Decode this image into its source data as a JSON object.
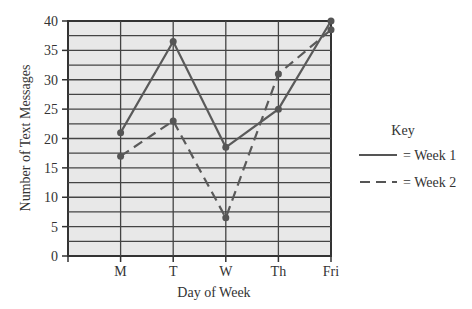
{
  "chart_data": {
    "type": "line",
    "title": "",
    "xlabel": "Day of Week",
    "ylabel": "Number of Text Messages",
    "categories": [
      "M",
      "T",
      "W",
      "Th",
      "Fri"
    ],
    "series": [
      {
        "name": "Week 1",
        "style": "solid",
        "values": [
          21,
          36.5,
          18.5,
          25,
          40
        ]
      },
      {
        "name": "Week 2",
        "style": "dashed",
        "values": [
          17,
          23,
          6.5,
          31,
          38.5
        ]
      }
    ],
    "ylim": [
      0,
      40
    ],
    "yticks": [
      0,
      5,
      10,
      15,
      20,
      25,
      30,
      35,
      40
    ],
    "grid": true,
    "legend": {
      "title": "Key",
      "position": "right",
      "entries": [
        "= Week 1",
        "= Week 2"
      ]
    }
  }
}
